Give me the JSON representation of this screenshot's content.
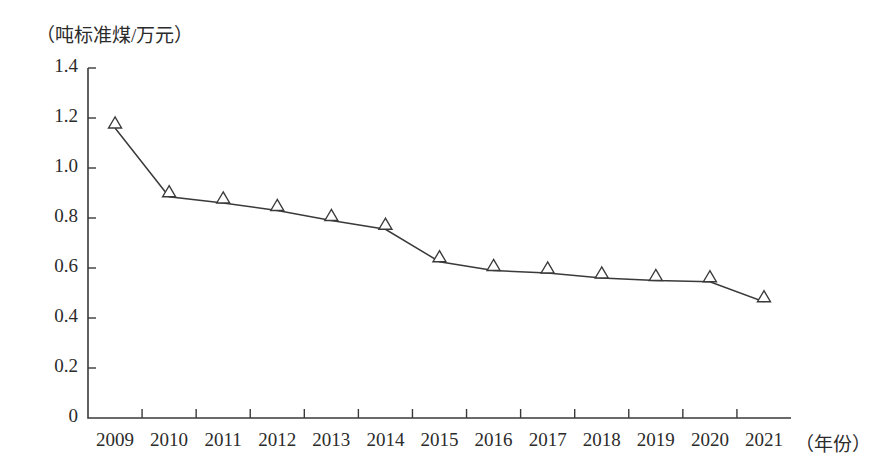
{
  "chart_data": {
    "type": "line",
    "title": "",
    "subtitle": "",
    "ylabel": "（吨标准煤/万元）",
    "xlabel": "（年份）",
    "categories": [
      "2009",
      "2010",
      "2011",
      "2012",
      "2013",
      "2014",
      "2015",
      "2016",
      "2017",
      "2018",
      "2019",
      "2020",
      "2021"
    ],
    "values": [
      1.16,
      0.885,
      0.86,
      0.83,
      0.79,
      0.755,
      0.625,
      0.59,
      0.58,
      0.56,
      0.55,
      0.545,
      0.465
    ],
    "series": [
      {
        "name": "单位GDP能耗",
        "values": [
          1.16,
          0.885,
          0.86,
          0.83,
          0.79,
          0.755,
          0.625,
          0.59,
          0.58,
          0.56,
          0.55,
          0.545,
          0.465
        ]
      }
    ],
    "ylim": [
      0,
      1.4
    ],
    "y_ticks": [
      "0",
      "0.2",
      "0.4",
      "0.6",
      "0.8",
      "1.0",
      "1.2",
      "1.4"
    ],
    "y_tick_values": [
      0,
      0.2,
      0.4,
      0.6,
      0.8,
      1.0,
      1.2,
      1.4
    ],
    "grid": false,
    "legend": "none",
    "marker": "open-triangle",
    "line_color": "#3a3a3a",
    "marker_fill": "#ffffff",
    "marker_stroke": "#3a3a3a",
    "axis_color": "#3a3a3a",
    "background": "#ffffff"
  }
}
